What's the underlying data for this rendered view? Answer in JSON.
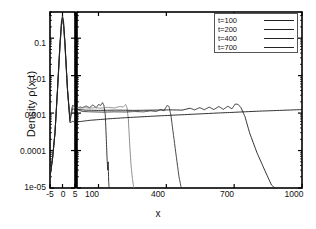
{
  "chart_data": {
    "type": "line",
    "title": "",
    "xlabel": "x",
    "ylabel": "Density ρ(x,t)",
    "yscale": "log",
    "ylim": [
      1e-05,
      0.5
    ],
    "yticks": [
      "0.1",
      "0.01",
      "0.001",
      "0.0001",
      "1e-05"
    ],
    "ytick_values": [
      0.1,
      0.01,
      0.001,
      0.0001,
      1e-05
    ],
    "broken_axis": true,
    "xlim_inset": [
      -5,
      5
    ],
    "xlim_main": [
      5,
      1000
    ],
    "xticks_inset": [
      "-5",
      "0",
      "5"
    ],
    "xticks_inset_values": [
      -5,
      0,
      5
    ],
    "xticks_main": [
      "100",
      "400",
      "700",
      "1000"
    ],
    "xticks_main_values": [
      100,
      400,
      700,
      1000
    ],
    "grid": false,
    "legend_position": "top-right",
    "legend": [
      "t=100",
      "t=200",
      "t=400",
      "t=700"
    ],
    "series": [
      {
        "name": "t=100",
        "color": "#222222",
        "front_position": 130,
        "plateau_level": 0.0015,
        "peak_at_origin": 0.3,
        "points_inset": [
          [
            -5,
            2e-05
          ],
          [
            -4,
            6e-05
          ],
          [
            -3,
            0.0003
          ],
          [
            -2,
            0.004
          ],
          [
            -1,
            0.06
          ],
          [
            -0.4,
            0.22
          ],
          [
            0,
            0.3
          ],
          [
            0.4,
            0.22
          ],
          [
            1,
            0.06
          ],
          [
            2,
            0.004
          ],
          [
            3,
            0.0007
          ],
          [
            4,
            0.0016
          ],
          [
            5,
            0.0015
          ]
        ],
        "points_main": [
          [
            5,
            0.0015
          ],
          [
            10,
            0.0014
          ],
          [
            20,
            0.00145
          ],
          [
            30,
            0.0014
          ],
          [
            45,
            0.00155
          ],
          [
            60,
            0.0014
          ],
          [
            75,
            0.00165
          ],
          [
            90,
            0.0014
          ],
          [
            100,
            0.0017
          ],
          [
            110,
            0.0016
          ],
          [
            118,
            0.0019
          ],
          [
            124,
            0.0016
          ],
          [
            130,
            0.0009
          ],
          [
            134,
            0.00025
          ],
          [
            138,
            6e-05
          ],
          [
            141,
            3e-05
          ],
          [
            143,
            5e-05
          ],
          [
            145,
            1.5e-05
          ],
          [
            147,
            1e-05
          ]
        ]
      },
      {
        "name": "t=200",
        "color": "#808080",
        "front_position": 230,
        "plateau_level": 0.0014,
        "peak_at_origin": 0.33,
        "points_inset": [
          [
            -5,
            2e-05
          ],
          [
            -4,
            6e-05
          ],
          [
            -3,
            0.0003
          ],
          [
            -2,
            0.004
          ],
          [
            -1,
            0.065
          ],
          [
            -0.4,
            0.24
          ],
          [
            0,
            0.33
          ],
          [
            0.4,
            0.24
          ],
          [
            1,
            0.065
          ],
          [
            2,
            0.004
          ],
          [
            3,
            0.0007
          ],
          [
            4,
            0.0015
          ],
          [
            5,
            0.0014
          ]
        ],
        "points_main": [
          [
            5,
            0.0014
          ],
          [
            20,
            0.00135
          ],
          [
            40,
            0.0014
          ],
          [
            60,
            0.00135
          ],
          [
            85,
            0.0014
          ],
          [
            110,
            0.00135
          ],
          [
            140,
            0.00142
          ],
          [
            170,
            0.00137
          ],
          [
            195,
            0.0015
          ],
          [
            210,
            0.00145
          ],
          [
            220,
            0.0017
          ],
          [
            226,
            0.0014
          ],
          [
            232,
            0.0007
          ],
          [
            238,
            0.00015
          ],
          [
            244,
            4e-05
          ],
          [
            250,
            1.8e-05
          ],
          [
            256,
            1e-05
          ]
        ]
      },
      {
        "name": "t=400",
        "color": "#333333",
        "front_position": 420,
        "plateau_level": 0.00105,
        "peak_at_origin": 0.36,
        "points_inset": [
          [
            -5,
            2e-05
          ],
          [
            -4,
            6e-05
          ],
          [
            -3,
            0.0003
          ],
          [
            -2,
            0.0042
          ],
          [
            -1,
            0.07
          ],
          [
            -0.4,
            0.26
          ],
          [
            0,
            0.36
          ],
          [
            0.4,
            0.26
          ],
          [
            1,
            0.07
          ],
          [
            2,
            0.0042
          ],
          [
            3,
            0.0006
          ],
          [
            4,
            0.0013
          ],
          [
            5,
            0.00125
          ]
        ],
        "points_main": [
          [
            5,
            0.00125
          ],
          [
            30,
            0.0011
          ],
          [
            70,
            0.00108
          ],
          [
            120,
            0.00106
          ],
          [
            170,
            0.00108
          ],
          [
            220,
            0.00107
          ],
          [
            260,
            0.0011
          ],
          [
            300,
            0.00108
          ],
          [
            330,
            0.00115
          ],
          [
            355,
            0.0011
          ],
          [
            375,
            0.00125
          ],
          [
            390,
            0.00115
          ],
          [
            403,
            0.0016
          ],
          [
            412,
            0.0015
          ],
          [
            420,
            0.0009
          ],
          [
            432,
            0.00025
          ],
          [
            444,
            7e-05
          ],
          [
            456,
            2e-05
          ],
          [
            466,
            1e-05
          ]
        ]
      },
      {
        "name": "t=700",
        "color": "#1a1a1a",
        "front_position": 730,
        "plateau_level": 0.0009,
        "peak_at_origin": 0.4,
        "points_inset": [
          [
            -5,
            2e-05
          ],
          [
            -4,
            6e-05
          ],
          [
            -3,
            0.0003
          ],
          [
            -2,
            0.0045
          ],
          [
            -1,
            0.075
          ],
          [
            -0.4,
            0.29
          ],
          [
            0,
            0.4
          ],
          [
            0.4,
            0.29
          ],
          [
            1,
            0.075
          ],
          [
            2,
            0.0045
          ],
          [
            3,
            0.00055
          ],
          [
            4,
            0.0006
          ],
          [
            5,
            0.00058
          ]
        ],
        "points_main": [
          [
            5,
            0.00058
          ],
          [
            60,
            0.00064
          ],
          [
            140,
            0.0007
          ],
          [
            230,
            0.00076
          ],
          [
            330,
            0.00082
          ],
          [
            430,
            0.00088
          ],
          [
            530,
            0.00094
          ],
          [
            620,
            0.001
          ],
          [
            700,
            0.00105
          ],
          [
            800,
            0.00112
          ],
          [
            900,
            0.00118
          ],
          [
            1000,
            0.00124
          ]
        ]
      },
      {
        "name": "t=700-front",
        "color": "#1a1a1a",
        "is_front_branch": true,
        "points_main": [
          [
            5,
            0.00125
          ],
          [
            40,
            0.0012
          ],
          [
            100,
            0.00118
          ],
          [
            180,
            0.0012
          ],
          [
            260,
            0.00118
          ],
          [
            340,
            0.0012
          ],
          [
            420,
            0.00122
          ],
          [
            470,
            0.0012
          ],
          [
            505,
            0.00135
          ],
          [
            525,
            0.00122
          ],
          [
            548,
            0.0014
          ],
          [
            568,
            0.00123
          ],
          [
            590,
            0.00145
          ],
          [
            610,
            0.00124
          ],
          [
            632,
            0.0015
          ],
          [
            652,
            0.00126
          ],
          [
            672,
            0.00152
          ],
          [
            690,
            0.0013
          ],
          [
            705,
            0.00175
          ],
          [
            718,
            0.0017
          ],
          [
            730,
            0.0014
          ],
          [
            748,
            0.0008
          ],
          [
            768,
            0.0003
          ],
          [
            800,
            9e-05
          ],
          [
            835,
            3e-05
          ],
          [
            865,
            1.2e-05
          ],
          [
            880,
            1e-05
          ]
        ]
      }
    ]
  },
  "axes": {
    "inset_panel_label": "inset-axis--5-to-5",
    "main_panel_label": "main-axis-5-to-1000"
  }
}
